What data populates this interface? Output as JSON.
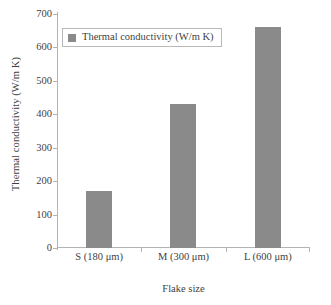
{
  "chart_data": {
    "type": "bar",
    "title": "",
    "categories": [
      "S (180 μm)",
      "M (300 μm)",
      "L (600 μm)"
    ],
    "values": [
      170,
      430,
      660
    ],
    "series": [
      {
        "name": "Thermal conductivity (W/m K)",
        "values": [
          170,
          430,
          660
        ],
        "color": "#8a8a8a"
      }
    ],
    "xlabel": "Flake size",
    "ylabel": "Thermal conductivity (W/m K)",
    "ylim": [
      0,
      700
    ],
    "ytick_step": 100,
    "yticks": [
      0,
      100,
      200,
      300,
      400,
      500,
      600,
      700
    ],
    "ytick_labels": [
      "0",
      "100",
      "200",
      "300",
      "400",
      "500",
      "600",
      "700"
    ],
    "grid": false,
    "legend": {
      "position": "top-left",
      "entries": [
        "Thermal conductivity (W/m K)"
      ],
      "bordered": true
    }
  },
  "legend": {
    "label": "Thermal conductivity (W/m K)"
  },
  "axes": {
    "y_title": "Thermal conductivity (W/m K)",
    "x_title": "Flake size"
  },
  "colors": {
    "bar": "#8a8a8a",
    "axis": "#b3b3b3",
    "text": "#3f3f3f",
    "legend_border": "#b9b9b9",
    "background": "#ffffff"
  }
}
